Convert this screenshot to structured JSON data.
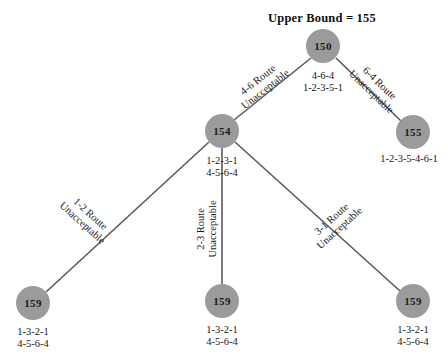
{
  "diagram": {
    "title": "Upper Bound = 155",
    "node_fill_color": "#9b9b9b",
    "edge_color": "#5a5a60",
    "nodes": [
      {
        "id": "root",
        "value": "150",
        "cx": 323,
        "cy": 46,
        "r": 17
      },
      {
        "id": "n154",
        "value": "154",
        "cx": 222,
        "cy": 131,
        "r": 17
      },
      {
        "id": "n155",
        "value": "155",
        "cx": 413,
        "cy": 132,
        "r": 17
      },
      {
        "id": "leaf_left",
        "value": "159",
        "cx": 33,
        "cy": 303,
        "r": 17
      },
      {
        "id": "leaf_mid",
        "value": "159",
        "cx": 222,
        "cy": 301,
        "r": 17
      },
      {
        "id": "leaf_right",
        "value": "159",
        "cx": 413,
        "cy": 301,
        "r": 17
      }
    ],
    "root_note": {
      "line1": "4-6-4",
      "line2": "1-2-3-5-1",
      "x": 323,
      "y": 82
    },
    "n154_note": {
      "line1": "1-2-3-1",
      "line2": "4-5-6-4",
      "x": 222,
      "y": 167
    },
    "node_captions": [
      {
        "id": "cap155",
        "line1": "1-2-3-5-4-6-1",
        "line2": "",
        "x": 409,
        "y": 159
      },
      {
        "id": "cap_leaf_left",
        "line1": "1-3-2-1",
        "line2": "4-5-6-4",
        "x": 33,
        "y": 338
      },
      {
        "id": "cap_leaf_mid",
        "line1": "1-3-2-1",
        "line2": "4-5-6-4",
        "x": 222,
        "y": 336
      },
      {
        "id": "cap_leaf_right",
        "line1": "1-3-2-1",
        "line2": "4-5-6-4",
        "x": 413,
        "y": 336
      }
    ],
    "edges": [
      {
        "id": "root-to-154",
        "x1": 311,
        "y1": 58,
        "x2": 234,
        "y2": 120
      },
      {
        "id": "root-to-155",
        "x1": 336,
        "y1": 58,
        "x2": 401,
        "y2": 121
      },
      {
        "id": "n154-to-leaf-left",
        "x1": 209,
        "y1": 142,
        "x2": 46,
        "y2": 292
      },
      {
        "id": "n154-to-leaf-mid",
        "x1": 222,
        "y1": 148,
        "x2": 222,
        "y2": 284
      },
      {
        "id": "n154-to-leaf-right",
        "x1": 235,
        "y1": 142,
        "x2": 400,
        "y2": 291
      }
    ],
    "edge_labels": [
      {
        "id": "lbl-4-6",
        "line1": "4-6 Route",
        "line2": "Unacceptable",
        "x": 262,
        "y": 85,
        "rotate": -38
      },
      {
        "id": "lbl-6-4",
        "line1": "6-4 Route",
        "line2": "Unacceptable",
        "x": 375,
        "y": 88,
        "rotate": 44
      },
      {
        "id": "lbl-1-2",
        "line1": "1-2 Route",
        "line2": "Unacceptable",
        "x": 86,
        "y": 219,
        "rotate": 42
      },
      {
        "id": "lbl-2-3",
        "line1": "2-3 Route",
        "line2": "Unacceptable",
        "x": 207,
        "y": 229,
        "rotate": -90
      },
      {
        "id": "lbl-3-1",
        "line1": "3-1 Route",
        "line2": "Unacceptable",
        "x": 336,
        "y": 224,
        "rotate": -42
      }
    ]
  }
}
